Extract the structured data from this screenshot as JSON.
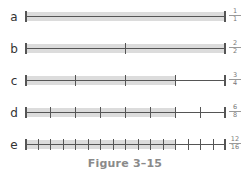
{
  "figure": {
    "caption": "Figure 3–15",
    "colors": {
      "shade": "#dcdcdc",
      "line": "#555555",
      "caption": "#8a8a8a"
    }
  },
  "rows": [
    {
      "label": "a",
      "parts": 1,
      "shaded": 1,
      "fraction": {
        "num": "1",
        "den": "1"
      }
    },
    {
      "label": "b",
      "parts": 2,
      "shaded": 2,
      "fraction": {
        "num": "2",
        "den": "2"
      }
    },
    {
      "label": "c",
      "parts": 4,
      "shaded": 3,
      "fraction": {
        "num": "3",
        "den": "4"
      }
    },
    {
      "label": "d",
      "parts": 8,
      "shaded": 6,
      "fraction": {
        "num": "6",
        "den": "8"
      }
    },
    {
      "label": "e",
      "parts": 16,
      "shaded": 12,
      "fraction": {
        "num": "12",
        "den": "16"
      }
    }
  ]
}
